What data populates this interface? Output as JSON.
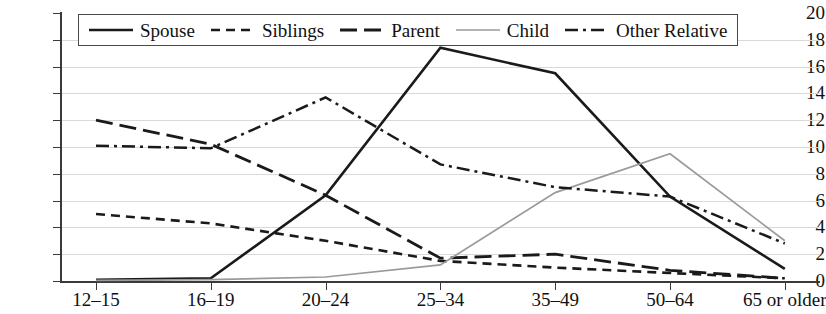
{
  "chart_data": {
    "type": "line",
    "title": "",
    "xlabel": "",
    "ylabel": "",
    "ylim": [
      0,
      20
    ],
    "ytick_step": 2,
    "grid": true,
    "legend_position": "top",
    "categories": [
      "12–15",
      "16–19",
      "20–24",
      "25–34",
      "35–49",
      "50–64",
      "65 or older"
    ],
    "series": [
      {
        "name": "Spouse",
        "style": "solid",
        "color": "#1a1a1a",
        "values": [
          0.1,
          0.2,
          6.4,
          17.4,
          15.5,
          6.3,
          0.9
        ]
      },
      {
        "name": "Siblings",
        "style": "dotted",
        "color": "#1a1a1a",
        "values": [
          5.0,
          4.3,
          3.0,
          1.5,
          1.0,
          0.6,
          0.2
        ]
      },
      {
        "name": "Parent",
        "style": "dashed",
        "color": "#1a1a1a",
        "values": [
          12.0,
          10.2,
          6.4,
          1.7,
          2.0,
          0.8,
          0.2
        ]
      },
      {
        "name": "Child",
        "style": "solid-light",
        "color": "#9a9a9a",
        "values": [
          0.05,
          0.1,
          0.3,
          1.2,
          6.6,
          9.5,
          3.0
        ]
      },
      {
        "name": "Other Relative",
        "style": "dash-dot",
        "color": "#1a1a1a",
        "values": [
          10.1,
          9.9,
          13.7,
          8.7,
          7.0,
          6.3,
          2.8
        ]
      }
    ],
    "ytick_labels": [
      "0",
      "2",
      "4",
      "6",
      "8",
      "10",
      "12",
      "14",
      "16",
      "18",
      "20"
    ]
  },
  "legend": {
    "items": [
      {
        "label": "Spouse",
        "swatch": "solid-line-swatch"
      },
      {
        "label": "Siblings",
        "swatch": "dotted-line-swatch"
      },
      {
        "label": "Parent",
        "swatch": "dashed-line-swatch"
      },
      {
        "label": "Child",
        "swatch": "light-solid-line-swatch"
      },
      {
        "label": "Other Relative",
        "swatch": "dash-dot-line-swatch"
      }
    ]
  }
}
